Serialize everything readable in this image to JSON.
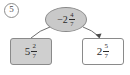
{
  "problem": {
    "number": "5"
  },
  "diagram": {
    "type": "number-decomposition-tree",
    "root": {
      "name": "mixed-number-oval",
      "sign": "−",
      "whole": "2",
      "numerator": "4",
      "denominator": "7",
      "full_text": "−2 4/7",
      "fill_color": "#c9c9c9",
      "border_color": "#8a8a8a"
    },
    "children": [
      {
        "name": "left-box",
        "sign": "",
        "whole": "5",
        "numerator": "2",
        "denominator": "7",
        "full_text": "5 2/7",
        "fill_color": "#cfcfcf",
        "border_color": "#8a8a8a",
        "connector": "curve-no-arrow"
      },
      {
        "name": "right-box",
        "sign": "",
        "whole": "2",
        "numerator": "5",
        "denominator": "7",
        "full_text": "2 5/7",
        "fill_color": "#ffffff",
        "border_color": "#8a8a8a",
        "connector": "curve-with-arrow"
      }
    ],
    "line_color": "#6f6f6f",
    "text_color": "#2b2b2b"
  }
}
